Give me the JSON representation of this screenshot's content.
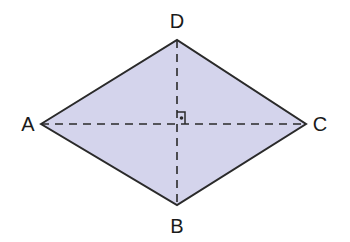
{
  "diagram": {
    "type": "rhombus",
    "fill_color": "#d4d4ec",
    "stroke_color": "#2a2a2a",
    "vertices": {
      "A": {
        "label": "A",
        "x": 41,
        "y": 124
      },
      "B": {
        "label": "B",
        "x": 177,
        "y": 205
      },
      "C": {
        "label": "C",
        "x": 306,
        "y": 124
      },
      "D": {
        "label": "D",
        "x": 177,
        "y": 40
      }
    },
    "diagonals": [
      {
        "from": "A",
        "to": "C",
        "style": "dashed"
      },
      {
        "from": "D",
        "to": "B",
        "style": "dashed"
      }
    ],
    "right_angle_marker": {
      "at": "center",
      "dot": true
    }
  }
}
